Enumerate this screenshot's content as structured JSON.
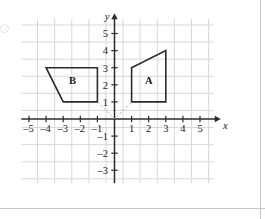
{
  "figure": {
    "axis_names": {
      "x": "x",
      "y": "y"
    },
    "colors": {
      "grid": "#d8d8d8",
      "axis": "#2b2b2b",
      "shape_stroke": "#2b2b2b",
      "dashed": "#b0b0b0",
      "text": "#1a1a1a",
      "page_rule": "#c9c9c9",
      "background": "#ffffff"
    }
  },
  "chart_data": {
    "type": "scatter",
    "title": "",
    "xlabel": "x",
    "ylabel": "y",
    "xlim": [
      -5.6,
      5.8
    ],
    "ylim": [
      -3.6,
      5.8
    ],
    "grid": true,
    "legend": "none",
    "x_ticks": [
      -5,
      -4,
      -3,
      -2,
      -1,
      1,
      2,
      3,
      4,
      5
    ],
    "x_tick_labels": [
      "–5",
      "–4",
      "–3",
      "–2",
      "–1",
      "1",
      "2",
      "3",
      "4",
      "5"
    ],
    "y_ticks": [
      5,
      4,
      3,
      2,
      1,
      -1,
      -2,
      -3
    ],
    "y_tick_labels": [
      "5",
      "4",
      "3",
      "2",
      "1",
      "–1",
      "–2",
      "–3"
    ],
    "shapes": [
      {
        "name": "A",
        "label": "A",
        "label_point": [
          2,
          2.25
        ],
        "closed": true,
        "vertices": [
          [
            1,
            1
          ],
          [
            1,
            3
          ],
          [
            3,
            4
          ],
          [
            3,
            1
          ]
        ]
      },
      {
        "name": "B",
        "label": "B",
        "label_point": [
          -2.45,
          2.25
        ],
        "closed": true,
        "vertices": [
          [
            -4,
            3
          ],
          [
            -1,
            3
          ],
          [
            -1,
            1
          ],
          [
            -3,
            1
          ]
        ]
      }
    ],
    "annotations": [
      {
        "name": "dashed-v-through-origin",
        "style": "dashed",
        "points": [
          [
            -1,
            1
          ],
          [
            0,
            0
          ],
          [
            1,
            1
          ]
        ]
      }
    ]
  }
}
